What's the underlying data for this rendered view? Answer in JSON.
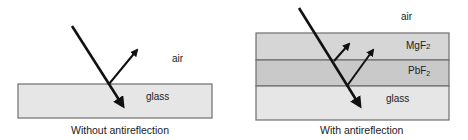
{
  "left_panel": {
    "caption": "Without antireflection",
    "labels": {
      "air": "air",
      "glass": "glass"
    },
    "layers": [
      {
        "name": "glass",
        "color": "#e6e6e6"
      }
    ]
  },
  "right_panel": {
    "caption": "With antireflection",
    "labels": {
      "air": "air",
      "mgf2_base": "MgF",
      "mgf2_sub": "2",
      "pbf2_base": "PbF",
      "pbf2_sub": "2",
      "glass": "glass"
    },
    "layers": [
      {
        "name": "MgF2",
        "color": "#d6d6d6"
      },
      {
        "name": "PbF2",
        "color": "#c9c9c9"
      },
      {
        "name": "glass",
        "color": "#e6e6e6"
      }
    ]
  },
  "colors": {
    "border": "#6e6e6e",
    "ray": "#111111"
  }
}
